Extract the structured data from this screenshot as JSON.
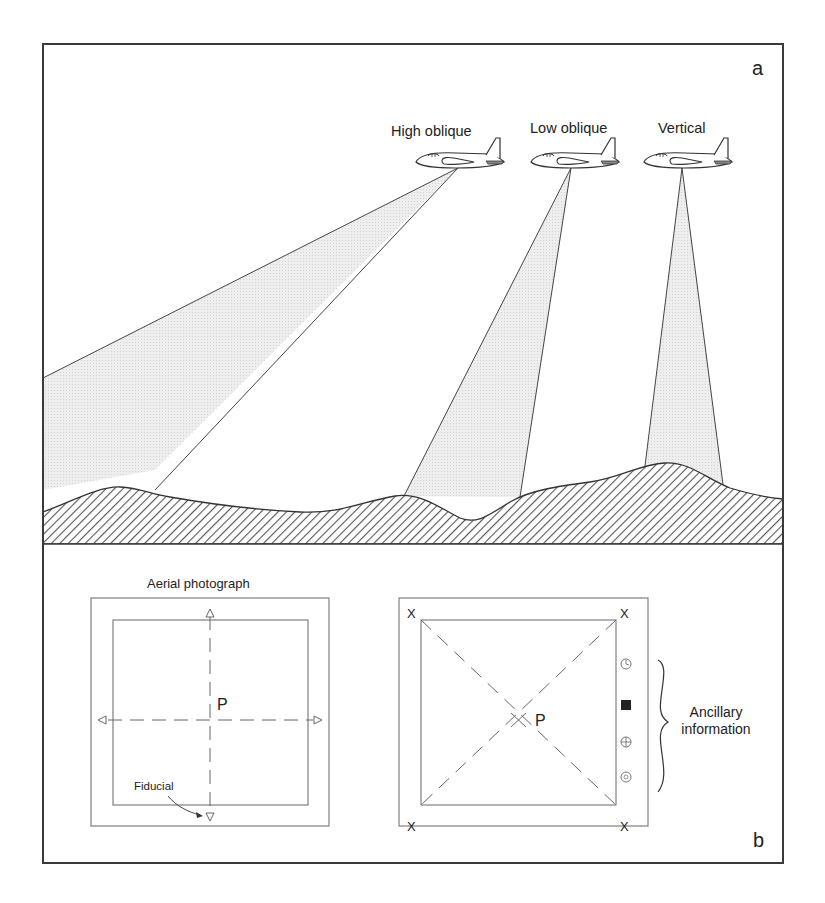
{
  "panel_a": {
    "label": "a",
    "aircraft": [
      {
        "label": "High oblique"
      },
      {
        "label": "Low oblique"
      },
      {
        "label": "Vertical"
      }
    ]
  },
  "panel_b": {
    "label": "b",
    "left_photo": {
      "title": "Aerial photograph",
      "principal_point": "P",
      "fiducial_label": "Fiducial"
    },
    "right_photo": {
      "principal_point": "P",
      "corner_marks": [
        "X",
        "X",
        "X",
        "X"
      ],
      "ancillary_icons": [
        "clock-icon",
        "black-square-icon",
        "level-bubble-icon",
        "altimeter-icon"
      ],
      "ancillary_label_line1": "Ancillary",
      "ancillary_label_line2": "information"
    }
  },
  "colors": {
    "line": "#333333",
    "frame": "#3a3a3a",
    "shade": "#e6e6e6",
    "hatch": "#555555"
  }
}
